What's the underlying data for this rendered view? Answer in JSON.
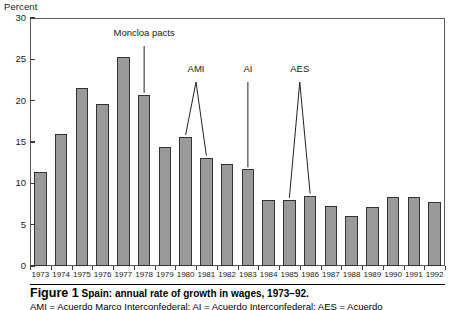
{
  "figure": {
    "y_axis_title": "Percent",
    "number_label": "Figure 1",
    "title": "Spain: annual rate of growth in wages, 1973–92.",
    "note": "AMI = Acuerdo Marco Interconfederal; AI = Acuerdo Interconfederal; AES = Acuerdo"
  },
  "chart_data": {
    "type": "bar",
    "title": "Spain: annual rate of growth in wages, 1973–92.",
    "xlabel": "",
    "ylabel": "Percent",
    "ylim": [
      0,
      30
    ],
    "yticks": [
      0,
      5,
      10,
      15,
      20,
      25,
      30
    ],
    "grid": false,
    "legend": "none",
    "bar_color": "#9a9a9a",
    "bar_border_color": "#333333",
    "categories": [
      "1973",
      "1974",
      "1975",
      "1976",
      "1977",
      "1978",
      "1979",
      "1980",
      "1981",
      "1982",
      "1983",
      "1984",
      "1985",
      "1986",
      "1987",
      "1988",
      "1989",
      "1990",
      "1991",
      "1992"
    ],
    "values": [
      11.4,
      16.0,
      21.5,
      19.6,
      25.3,
      20.7,
      14.4,
      15.6,
      13.1,
      12.4,
      11.7,
      8.0,
      8.0,
      8.5,
      7.3,
      6.1,
      7.1,
      8.3,
      8.3,
      7.7
    ],
    "annotations": [
      {
        "label": "Moncloa pacts",
        "points": [
          "1978"
        ]
      },
      {
        "label": "AMI",
        "points": [
          "1980",
          "1981"
        ]
      },
      {
        "label": "AI",
        "points": [
          "1983"
        ]
      },
      {
        "label": "AES",
        "points": [
          "1985",
          "1986"
        ]
      }
    ]
  }
}
